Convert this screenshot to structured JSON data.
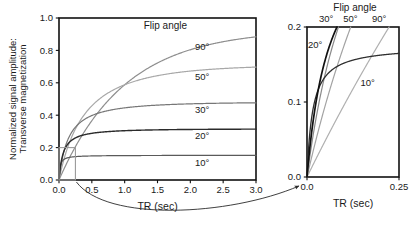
{
  "figure": {
    "background": "#ffffff",
    "legend_title": "Flip angle"
  },
  "chart_data": [
    {
      "id": "main",
      "type": "line",
      "title": "",
      "legend_title": "Flip angle",
      "legend_position": "inline-right",
      "grid": false,
      "xlabel": "TR  (sec)",
      "ylabel": "Normalized signal amplitude: Transverse magnetization",
      "ylabel_line1": "Normalized signal amplitude:",
      "ylabel_line2": "Transverse magnetization",
      "xlim": [
        0.0,
        3.0
      ],
      "ylim": [
        0.0,
        1.0
      ],
      "xticks": [
        0.0,
        0.5,
        1.0,
        1.5,
        2.0,
        2.5,
        3.0
      ],
      "xticklabels": [
        "0.0",
        "0.5",
        "1.0",
        "1.5",
        "2.0",
        "2.5",
        "3.0"
      ],
      "yticks": [
        0.0,
        0.2,
        0.4,
        0.6,
        0.8,
        1.0
      ],
      "yticklabels": [
        "0.0",
        "0.2",
        "0.4",
        "0.6",
        "0.8",
        "1.0"
      ],
      "model": "steady-state spoiled gradient echo: S = sin(a)*(1-E1)/(1-cos(a)*E1), E1 = exp(-TR/T1), T1 = 1.0 s",
      "t1_seconds": 1.0,
      "series": [
        {
          "name": "90°",
          "flip_deg": 90,
          "color": "#8e8e8e",
          "width": 1.2,
          "label": "90°",
          "label_x": 2.18,
          "label_y": 0.8,
          "plateau": 0.93
        },
        {
          "name": "50°",
          "flip_deg": 50,
          "color": "#a8a8a8",
          "width": 1.2,
          "label": "50°",
          "label_x": 2.18,
          "label_y": 0.615,
          "plateau": 0.71
        },
        {
          "name": "30°",
          "flip_deg": 30,
          "color": "#777777",
          "width": 1.2,
          "label": "30°",
          "label_x": 2.18,
          "label_y": 0.415,
          "plateau": 0.48
        },
        {
          "name": "20°",
          "flip_deg": 20,
          "color": "#2b2b2b",
          "width": 1.4,
          "label": "20°",
          "label_x": 2.18,
          "label_y": 0.255,
          "plateau": 0.315
        },
        {
          "name": "10°",
          "flip_deg": 10,
          "color": "#5a5a5a",
          "width": 1.2,
          "label": "10°",
          "label_x": 2.18,
          "label_y": 0.085,
          "plateau": 0.152
        }
      ],
      "inset_box": {
        "x0": 0.0,
        "x1": 0.25,
        "y0": 0.0,
        "y1": 0.2,
        "color": "#9a9a9a"
      }
    },
    {
      "id": "inset",
      "type": "line",
      "title": "",
      "legend_title": "Flip angle",
      "legend_position": "top",
      "grid": false,
      "xlabel": "TR  (sec)",
      "ylabel": "",
      "xlim": [
        0.0,
        0.25
      ],
      "ylim": [
        0.0,
        0.2
      ],
      "xticks": [
        0.0,
        0.25
      ],
      "xticklabels": [
        "0.0",
        "0.25"
      ],
      "yticks": [
        0.0,
        0.1,
        0.2
      ],
      "yticklabels": [
        "0.0",
        "0.1",
        "0.2"
      ],
      "t1_seconds": 1.0,
      "series": [
        {
          "name": "30°",
          "flip_deg": 30,
          "color": "#8a8a8a",
          "width": 1.2,
          "label": "30°",
          "top_label": true
        },
        {
          "name": "50°",
          "flip_deg": 50,
          "color": "#a3a3a3",
          "width": 1.2,
          "label": "50°",
          "top_label": true
        },
        {
          "name": "90°",
          "flip_deg": 90,
          "color": "#b0b0b0",
          "width": 1.2,
          "label": "90°",
          "top_label": true
        },
        {
          "name": "20°",
          "flip_deg": 20,
          "color": "#111111",
          "width": 1.7,
          "label": "20°",
          "top_label": false
        },
        {
          "name": "10°",
          "flip_deg": 10,
          "color": "#2f2f2f",
          "width": 1.3,
          "label": "10°",
          "top_label": false
        }
      ],
      "top_labels": [
        "30°",
        "50°",
        "90°"
      ],
      "inline_labels": [
        {
          "text": "20°",
          "x": 0.022,
          "y": 0.172
        },
        {
          "text": "10°",
          "x": 0.165,
          "y": 0.122
        }
      ]
    }
  ],
  "connector": {
    "name": "zoom-connector-arrow",
    "description": "curved arrow from inset box to detail panel origin"
  }
}
